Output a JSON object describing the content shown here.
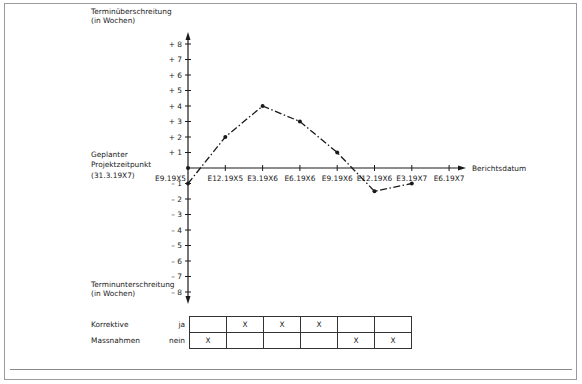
{
  "chart_data": {
    "type": "line",
    "title": "",
    "ylabel_top": "Terminüberschreitung (in Wochen)",
    "ylabel_bottom": "Terminunterschreitung (in Wochen)",
    "xlabel": "Berichtsdatum",
    "origin_label": "Geplanter Projektzeitpunkt (31.3.19X7)",
    "ylim": [
      -8,
      8
    ],
    "y_ticks": [
      "+8",
      "+7",
      "+6",
      "+5",
      "+4",
      "+3",
      "+2",
      "+1",
      "-1",
      "-2",
      "-3",
      "-4",
      "-5",
      "-6",
      "-7",
      "-8"
    ],
    "categories": [
      "E9.19X5",
      "E12.19X5",
      "E3.19X6",
      "E6.19X6",
      "E9.19X6",
      "E12.19X6",
      "E3.19X7",
      "E6.19X7"
    ],
    "series": [
      {
        "name": "Terminabweichung",
        "values": [
          -1,
          2,
          4,
          3,
          1,
          -1.5,
          -1,
          null
        ],
        "style": "dash-dot"
      }
    ],
    "grid": false,
    "legend": "none"
  },
  "labels": {
    "y_top_line1": "Terminüberschreitung",
    "y_top_line2": "(in Wochen)",
    "y_bottom_line1": "Terminunterschreitung",
    "y_bottom_line2": "(in Wochen)",
    "origin_line1": "Geplanter",
    "origin_line2": "Projektzeitpunkt",
    "origin_line3": "(31.3.19X7)",
    "x_axis": "Berichtsdatum"
  },
  "table": {
    "row_label_1": "Korrektive",
    "row_label_2": "Massnahmen",
    "opt_yes": "ja",
    "opt_no": "nein",
    "ja": [
      "",
      "X",
      "X",
      "X",
      "",
      ""
    ],
    "nein": [
      "X",
      "",
      "",
      "",
      "X",
      "X"
    ]
  }
}
